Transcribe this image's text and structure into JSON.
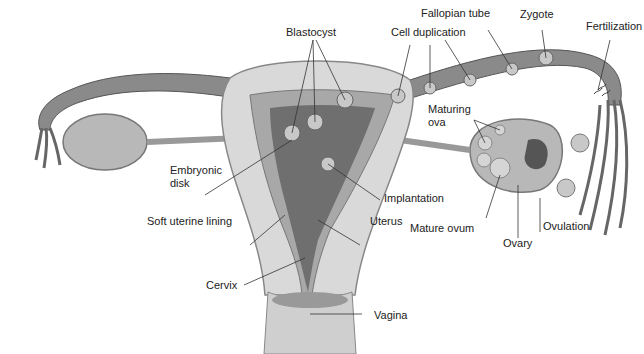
{
  "diagram": {
    "labels": {
      "blastocyst": "Blastocyst",
      "fallopian_tube": "Fallopian tube",
      "zygote": "Zygote",
      "cell_duplication": "Cell duplication",
      "fertilization": "Fertilization",
      "maturing_ova_1": "Maturing",
      "maturing_ova_2": "ova",
      "embryonic_disk_1": "Embryonic",
      "embryonic_disk_2": "disk",
      "implantation": "Implantation",
      "mature_ovum": "Mature ovum",
      "ovary": "Ovary",
      "ovulation": "Ovulation",
      "soft_uterine_lining": "Soft uterine lining",
      "uterus": "Uterus",
      "cervix": "Cervix",
      "vagina": "Vagina"
    },
    "colors": {
      "tube": "#8a8a8a",
      "tube_dark": "#5a5a5a",
      "wall": "#d9d9d9",
      "lining": "#a8a8a8",
      "cavity": "#6f6f6f",
      "ovary": "#b8b8b8",
      "cell": "#c8c8c8"
    }
  }
}
